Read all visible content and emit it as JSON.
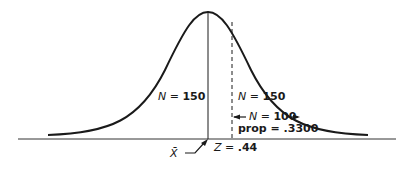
{
  "figure": {
    "type": "normal-distribution-diagram",
    "labels": {
      "left_region": {
        "var": "N",
        "eq": " = ",
        "value": "150"
      },
      "right_region": {
        "var": "N",
        "eq": " = ",
        "value": "150"
      },
      "shaded_region": {
        "var": "N",
        "eq": " = ",
        "value": "100"
      },
      "proportion": {
        "text": "prop = ",
        "value": ".3300"
      },
      "z_score": {
        "var": "Z",
        "eq": " = ",
        "value": ".44"
      },
      "mean": {
        "symbol": "X̄"
      }
    },
    "colors": {
      "line": "#1a1a1a",
      "background": "#ffffff"
    }
  }
}
